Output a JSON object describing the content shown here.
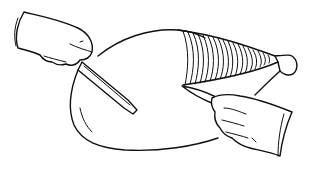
{
  "illustration": {
    "subject": "carving a ham",
    "elements": [
      {
        "name": "left-hand-with-cuff",
        "holds": "carving-fork"
      },
      {
        "name": "carving-fork"
      },
      {
        "name": "ham"
      },
      {
        "name": "ham-skin-striped-section"
      },
      {
        "name": "ham-bone-end"
      },
      {
        "name": "right-hand-with-cuff",
        "holds": "carving-knife"
      },
      {
        "name": "carving-knife"
      }
    ],
    "colors": {
      "ink": "#111111",
      "background": "#ffffff"
    }
  }
}
